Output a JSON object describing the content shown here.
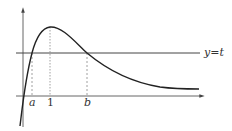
{
  "diagram": {
    "labels": {
      "a": "a",
      "one": "1",
      "b": "b",
      "line": "y=t"
    },
    "colors": {
      "curve": "#222222",
      "axis": "#444444",
      "guide": "#888888"
    }
  }
}
